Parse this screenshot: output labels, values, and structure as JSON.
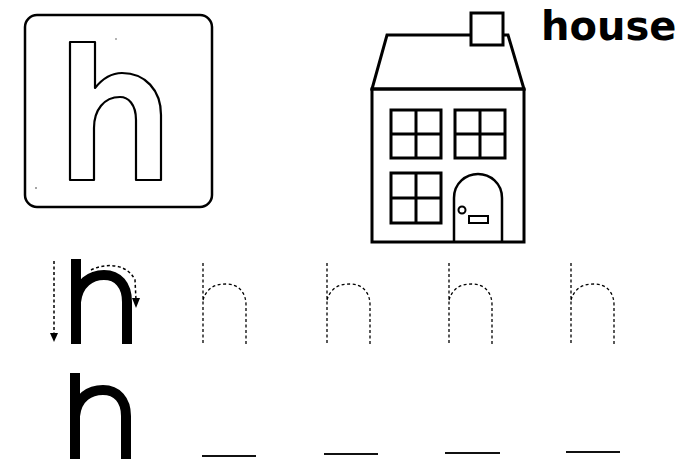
{
  "worksheet": {
    "letter": "h",
    "word": "house",
    "picture": "house",
    "trace_rows": {
      "row1": {
        "model_letter": "h",
        "dotted_letters": [
          "h",
          "h",
          "h",
          "h"
        ],
        "stroke_arrows": [
          "down-arrow",
          "curved-arrow-over-and-down"
        ]
      },
      "row2": {
        "model_letter": "h",
        "blank_lines": 4
      }
    },
    "colors": {
      "ink": "#000000",
      "paper": "#ffffff"
    }
  }
}
